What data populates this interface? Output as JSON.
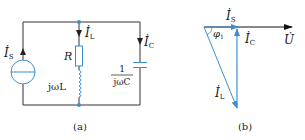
{
  "colors": {
    "wire": "#333333",
    "component": "#3b8fd0",
    "phasor": "#3b8fd0",
    "reference": "#111111",
    "text": "#1a1a1a"
  },
  "circuit_a": {
    "caption": "(a)",
    "source_label": "İ",
    "source_sub": "S",
    "resistor_label": "R",
    "inductor_label": "jωL",
    "current_L_label": "İ",
    "current_L_sub": "L",
    "current_C_label": "İ",
    "current_C_sub": "C",
    "capacitor_numerator": "1",
    "capacitor_denominator": "jωC"
  },
  "phasor_b": {
    "caption": "(b)",
    "voltage_label": "U̇",
    "is_label": "İ",
    "is_sub": "S",
    "ic_label": "İ",
    "ic_sub": "C",
    "il_label": "İ",
    "il_sub": "L",
    "angle_label": "φ",
    "angle_sub": "1"
  }
}
